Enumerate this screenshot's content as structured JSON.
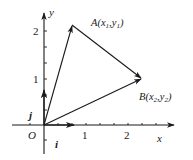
{
  "diagram": {
    "type": "vector-coordinate-plane",
    "colors": {
      "ink": "#1a1a1a",
      "background": "#ffffff"
    },
    "axes": {
      "x_label": "x",
      "y_label": "y",
      "origin_label": "O",
      "x_ticks": [
        "1",
        "2"
      ],
      "y_ticks": [
        "1",
        "2"
      ]
    },
    "unit_vectors": {
      "i_label": "i",
      "j_label": "j"
    },
    "points": {
      "A": {
        "label": "A(x₁,y₁)",
        "name": "A",
        "coord": "x₁,y₁",
        "approx": [
          0.65,
          2.1
        ]
      },
      "B": {
        "label": "B(x₂,y₂)",
        "name": "B",
        "coord": "x₂,y₂",
        "approx": [
          2.3,
          1.0
        ]
      }
    },
    "vectors": [
      {
        "from": "O",
        "to": "A",
        "name": "OA"
      },
      {
        "from": "O",
        "to": "B",
        "name": "OB"
      },
      {
        "from": "A",
        "to": "B",
        "name": "AB"
      }
    ]
  }
}
